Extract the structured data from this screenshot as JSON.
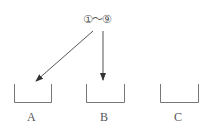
{
  "source": {
    "label": "①～⑨"
  },
  "containers": [
    {
      "id": "A",
      "label": "A"
    },
    {
      "id": "B",
      "label": "B"
    },
    {
      "id": "C",
      "label": "C"
    }
  ],
  "arrows": [
    {
      "from": "source",
      "to": "A"
    },
    {
      "from": "source",
      "to": "B"
    }
  ],
  "colors": {
    "line": "#666666",
    "text": "#555555"
  }
}
